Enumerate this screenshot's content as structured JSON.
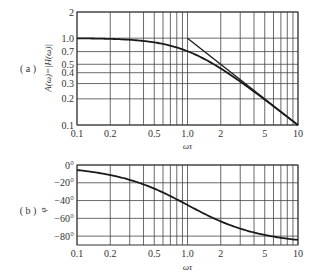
{
  "chart_data": [
    {
      "type": "line",
      "panel_label": "( a )",
      "title": "",
      "xlabel": "ωτ",
      "ylabel": "A(ω)=|H(ω)|",
      "xscale": "log",
      "yscale": "log",
      "xlim": [
        0.1,
        10
      ],
      "ylim": [
        0.1,
        2
      ],
      "grid": true,
      "x_ticks": [
        "0.1",
        "0.2",
        "0.5",
        "1.0",
        "2",
        "5",
        "10"
      ],
      "y_ticks": [
        "0.1",
        "0.2",
        "0.3",
        "0.4",
        "0.5",
        "0.7",
        "1.0",
        "2"
      ],
      "series": [
        {
          "name": "A(ω) = 1/sqrt(1+(ωτ)^2)",
          "x": [
            0.1,
            0.2,
            0.3,
            0.5,
            0.7,
            1.0,
            1.5,
            2,
            3,
            5,
            7,
            10
          ],
          "values": [
            0.995,
            0.981,
            0.958,
            0.894,
            0.819,
            0.707,
            0.555,
            0.447,
            0.316,
            0.196,
            0.141,
            0.0995
          ]
        },
        {
          "name": "high-frequency asymptote 1/(ωτ)",
          "x": [
            1.0,
            10
          ],
          "values": [
            1.0,
            0.1
          ]
        }
      ]
    },
    {
      "type": "line",
      "panel_label": "( b )",
      "title": "",
      "xlabel": "ωτ",
      "ylabel": "φ",
      "xscale": "log",
      "xlim": [
        0.1,
        10
      ],
      "ylim": [
        -90,
        0
      ],
      "grid": true,
      "x_ticks": [
        "0.1",
        "0.2",
        "0.5",
        "1.0",
        "2",
        "5",
        "10"
      ],
      "y_ticks": [
        "0°",
        "−20°",
        "−40°",
        "−60°",
        "−80°"
      ],
      "series": [
        {
          "name": "φ(ω) = −arctan(ωτ)",
          "x": [
            0.1,
            0.2,
            0.3,
            0.5,
            0.7,
            1.0,
            1.5,
            2,
            3,
            5,
            7,
            10
          ],
          "values": [
            -5.7,
            -11.3,
            -16.7,
            -26.6,
            -35.0,
            -45.0,
            -56.3,
            -63.4,
            -71.6,
            -78.7,
            -81.9,
            -84.3
          ]
        }
      ]
    }
  ]
}
